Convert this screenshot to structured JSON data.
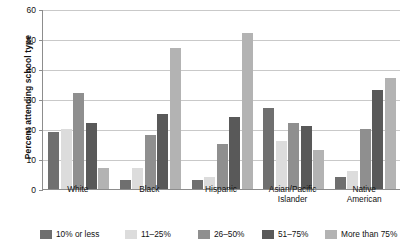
{
  "chart_data": {
    "type": "bar",
    "title": "",
    "xlabel": "",
    "ylabel": "Percent attending school type",
    "ylim": [
      0,
      60
    ],
    "yticks": [
      0,
      10,
      20,
      30,
      40,
      50,
      60
    ],
    "grid": true,
    "legend_position": "bottom",
    "categories": [
      "White",
      "Black",
      "Hispanic",
      "Asian/Pacific\nIslander",
      "Native\nAmerican"
    ],
    "series": [
      {
        "name": "10% or less",
        "color": "#6f6f6f",
        "values": [
          19,
          3,
          3,
          27,
          4
        ]
      },
      {
        "name": "11–25%",
        "color": "#dcdcdc",
        "values": [
          20,
          7,
          4,
          16,
          6
        ]
      },
      {
        "name": "26–50%",
        "color": "#8f8f8f",
        "values": [
          32,
          18,
          15,
          22,
          20
        ]
      },
      {
        "name": "51–75%",
        "color": "#595959",
        "values": [
          22,
          25,
          24,
          21,
          33
        ]
      },
      {
        "name": "More than 75%",
        "color": "#b3b3b3",
        "values": [
          7,
          47,
          52,
          13,
          37
        ]
      }
    ]
  },
  "axis": {
    "y_title": "Percent attending school type",
    "tick_labels": [
      "0",
      "10",
      "20",
      "30",
      "40",
      "50",
      "60"
    ]
  },
  "legend": {
    "items": [
      {
        "label": "10% or less"
      },
      {
        "label": "11–25%"
      },
      {
        "label": "26–50%"
      },
      {
        "label": "51–75%"
      },
      {
        "label": "More than 75%"
      }
    ]
  },
  "colors": {
    "axis": "#8d8d8d",
    "grid": "#c9c9c9",
    "text": "#111111",
    "background": "#ffffff"
  }
}
